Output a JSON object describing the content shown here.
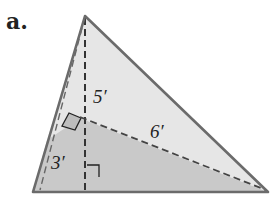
{
  "figure": {
    "label": "a.",
    "dimensions": {
      "height": "5′",
      "hypotenuse_segment": "6′",
      "short_segment": "3′"
    },
    "colors": {
      "light_region": "#e6e6e6",
      "dark_region": "#c9c9c9",
      "outline": "#6b6b6b",
      "dashed": "#333333"
    }
  }
}
